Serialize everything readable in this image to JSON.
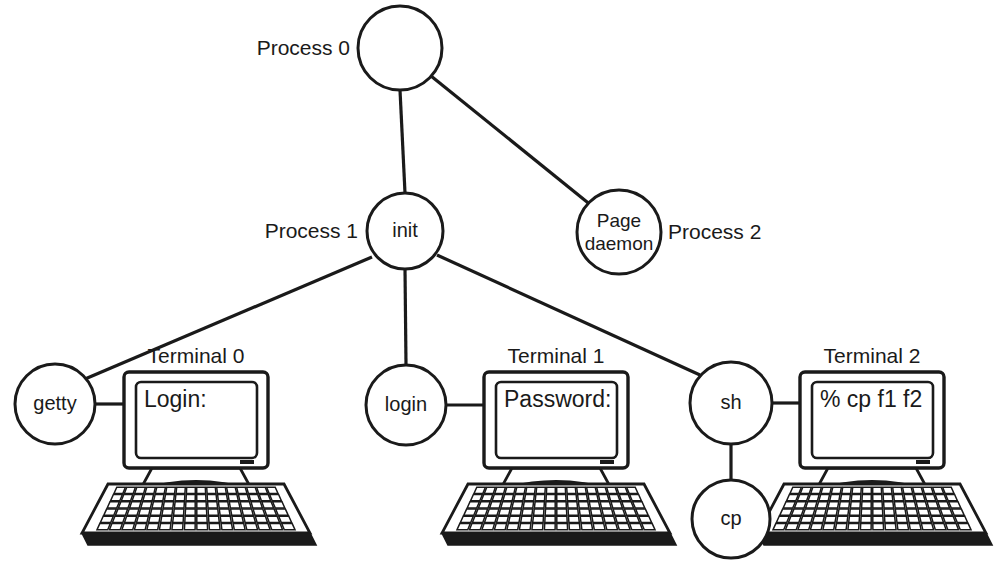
{
  "diagram": {
    "background_color": "#ffffff",
    "line_color": "#1a1a1a",
    "node_fill": "#ffffff",
    "nodes": [
      {
        "id": "process0",
        "label": "",
        "cx": 400,
        "cy": 48,
        "r": 42
      },
      {
        "id": "init",
        "label": "init",
        "cx": 405,
        "cy": 231,
        "r": 38
      },
      {
        "id": "pagedaemon",
        "label_line1": "Page",
        "label_line2": "daemon",
        "cx": 619,
        "cy": 232,
        "r": 42
      },
      {
        "id": "getty",
        "label": "getty",
        "cx": 55,
        "cy": 404,
        "r": 40
      },
      {
        "id": "login",
        "label": "login",
        "cx": 406,
        "cy": 405,
        "r": 40
      },
      {
        "id": "sh",
        "label": "sh",
        "cx": 731,
        "cy": 403,
        "r": 41
      },
      {
        "id": "cp",
        "label": "cp",
        "cx": 731,
        "cy": 519,
        "r": 39
      }
    ],
    "side_labels": [
      {
        "id": "process-0-label",
        "text": "Process 0",
        "x": 350,
        "y": 48,
        "align": "end"
      },
      {
        "id": "process-1-label",
        "text": "Process 1",
        "x": 358,
        "y": 231,
        "align": "end"
      },
      {
        "id": "process-2-label",
        "text": "Process 2",
        "x": 668,
        "y": 232,
        "align": "start"
      }
    ],
    "edges": [
      {
        "id": "edge-process0-init",
        "from": "process0",
        "to": "init"
      },
      {
        "id": "edge-process0-pagedaemon",
        "from": "process0",
        "to": "pagedaemon"
      },
      {
        "id": "edge-init-getty",
        "from": "init",
        "to": "getty"
      },
      {
        "id": "edge-init-login",
        "from": "init",
        "to": "login"
      },
      {
        "id": "edge-init-sh",
        "from": "init",
        "to": "sh"
      },
      {
        "id": "edge-sh-cp",
        "from": "sh",
        "to": "cp"
      },
      {
        "id": "edge-getty-terminal0",
        "from": "getty",
        "to": "terminal0"
      },
      {
        "id": "edge-login-terminal1",
        "from": "login",
        "to": "terminal1"
      },
      {
        "id": "edge-sh-terminal2",
        "from": "sh",
        "to": "terminal2"
      }
    ],
    "terminals": [
      {
        "id": "terminal0",
        "caption": "Terminal 0",
        "screen_text": "Login:",
        "x": 124,
        "y": 372
      },
      {
        "id": "terminal1",
        "caption": "Terminal 1",
        "screen_text": "Password:",
        "x": 484,
        "y": 372
      },
      {
        "id": "terminal2",
        "caption": "Terminal 2",
        "screen_text": "% cp f1 f2",
        "x": 800,
        "y": 372
      }
    ]
  }
}
